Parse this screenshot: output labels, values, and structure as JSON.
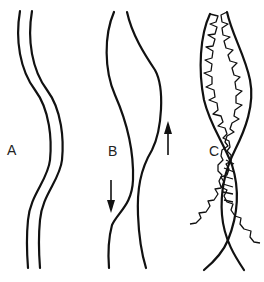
{
  "figure": {
    "panels": [
      {
        "id": "A",
        "label": "A",
        "description": "two parallel wavy strands"
      },
      {
        "id": "B",
        "label": "B",
        "description": "two diverging wavy strands with opposing arrows"
      },
      {
        "id": "C",
        "label": "C",
        "description": "two twisted strands with serrated scalloped edges crossing over"
      }
    ],
    "arrows": [
      {
        "panel": "B",
        "direction": "down"
      },
      {
        "panel": "B",
        "direction": "up"
      }
    ],
    "colors": {
      "ink": "#111111",
      "background": "#ffffff"
    }
  }
}
